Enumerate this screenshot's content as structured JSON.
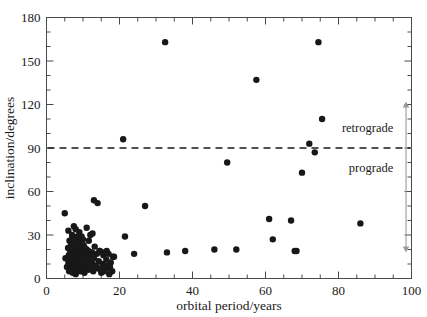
{
  "chart_data": {
    "type": "scatter",
    "title": "",
    "xlabel": "orbital period/years",
    "ylabel": "inclination/degrees",
    "xlim": [
      0,
      100
    ],
    "ylim": [
      0,
      180
    ],
    "xticks": [
      0,
      20,
      40,
      60,
      80,
      100
    ],
    "yticks": [
      0,
      30,
      60,
      90,
      120,
      150,
      180
    ],
    "x_minor_step": 5,
    "y_minor_step": 10,
    "grid": false,
    "legend": "none",
    "marker_color": "#181818",
    "marker_size_px": 3.2,
    "annotations": [
      {
        "name": "threshold-line",
        "type": "hline",
        "y": 90,
        "style": "dashed",
        "color": "#1a1a1a"
      },
      {
        "name": "retrograde-label",
        "type": "text",
        "text": "retrograde",
        "x": 95,
        "y": 104
      },
      {
        "name": "prograde-label",
        "type": "text",
        "text": "prograde",
        "x": 95,
        "y": 76
      },
      {
        "name": "range-arrow",
        "type": "double-arrow",
        "x": 98.5,
        "y_from": 18,
        "y_to": 122,
        "color": "#9a9a9a"
      }
    ],
    "points": [
      [
        5.2,
        14
      ],
      [
        5.6,
        8
      ],
      [
        5.9,
        21
      ],
      [
        6.0,
        11
      ],
      [
        6.1,
        16
      ],
      [
        6.2,
        5
      ],
      [
        6.3,
        26
      ],
      [
        6.4,
        13
      ],
      [
        6.5,
        19
      ],
      [
        6.6,
        9
      ],
      [
        6.7,
        23
      ],
      [
        6.8,
        6
      ],
      [
        6.9,
        17
      ],
      [
        7.0,
        12
      ],
      [
        7.1,
        28
      ],
      [
        7.2,
        4
      ],
      [
        7.3,
        20
      ],
      [
        7.4,
        15
      ],
      [
        7.5,
        10
      ],
      [
        7.6,
        24
      ],
      [
        7.7,
        7
      ],
      [
        7.8,
        18
      ],
      [
        7.9,
        13
      ],
      [
        8.0,
        3
      ],
      [
        8.1,
        22
      ],
      [
        8.2,
        16
      ],
      [
        8.3,
        9
      ],
      [
        8.4,
        27
      ],
      [
        8.5,
        12
      ],
      [
        8.6,
        6
      ],
      [
        8.7,
        19
      ],
      [
        8.8,
        14
      ],
      [
        8.9,
        25
      ],
      [
        9.0,
        8
      ],
      [
        9.1,
        17
      ],
      [
        9.2,
        11
      ],
      [
        9.3,
        5
      ],
      [
        9.4,
        21
      ],
      [
        9.5,
        15
      ],
      [
        9.6,
        29
      ],
      [
        9.7,
        10
      ],
      [
        9.8,
        18
      ],
      [
        9.9,
        7
      ],
      [
        10.0,
        13
      ],
      [
        10.2,
        23
      ],
      [
        10.4,
        4
      ],
      [
        10.6,
        16
      ],
      [
        10.8,
        9
      ],
      [
        11.0,
        20
      ],
      [
        11.2,
        12
      ],
      [
        11.4,
        6
      ],
      [
        11.6,
        26
      ],
      [
        11.8,
        15
      ],
      [
        12.0,
        8
      ],
      [
        12.2,
        18
      ],
      [
        12.4,
        11
      ],
      [
        12.6,
        31
      ],
      [
        12.8,
        5
      ],
      [
        13.0,
        14
      ],
      [
        13.2,
        22
      ],
      [
        13.5,
        9
      ],
      [
        13.8,
        17
      ],
      [
        14.0,
        7
      ],
      [
        14.3,
        12
      ],
      [
        14.6,
        19
      ],
      [
        15.0,
        4
      ],
      [
        15.3,
        10
      ],
      [
        15.6,
        16
      ],
      [
        16.0,
        6
      ],
      [
        16.4,
        13
      ],
      [
        16.8,
        8
      ],
      [
        17.2,
        3
      ],
      [
        17.6,
        11
      ],
      [
        18.0,
        5
      ],
      [
        18.5,
        15
      ],
      [
        5.0,
        45
      ],
      [
        6.0,
        33
      ],
      [
        7.0,
        30
      ],
      [
        7.5,
        36
      ],
      [
        8.0,
        34
      ],
      [
        8.5,
        29
      ],
      [
        9.0,
        32
      ],
      [
        10.0,
        27
      ],
      [
        11.0,
        35
      ],
      [
        12.0,
        30
      ],
      [
        13.0,
        54
      ],
      [
        14.0,
        52
      ],
      [
        10.5,
        21
      ],
      [
        11.5,
        19
      ],
      [
        12.5,
        18
      ],
      [
        14.5,
        19
      ],
      [
        15.5,
        18
      ],
      [
        16.5,
        19
      ],
      [
        17.0,
        17
      ],
      [
        18.2,
        15
      ],
      [
        16.2,
        9
      ],
      [
        16.6,
        7
      ],
      [
        17.4,
        8
      ],
      [
        15.8,
        5
      ],
      [
        14.8,
        6
      ],
      [
        21.0,
        96
      ],
      [
        21.5,
        29
      ],
      [
        24.0,
        17
      ],
      [
        27.0,
        50
      ],
      [
        32.5,
        163
      ],
      [
        33.0,
        18
      ],
      [
        38.0,
        19
      ],
      [
        46.0,
        20
      ],
      [
        49.5,
        80
      ],
      [
        52.0,
        20
      ],
      [
        57.5,
        137
      ],
      [
        61.0,
        41
      ],
      [
        62.0,
        27
      ],
      [
        67.0,
        40
      ],
      [
        68.0,
        19
      ],
      [
        68.5,
        19
      ],
      [
        70.0,
        73
      ],
      [
        72.0,
        93
      ],
      [
        73.5,
        87
      ],
      [
        74.5,
        163
      ],
      [
        75.5,
        110
      ],
      [
        86.0,
        38
      ]
    ]
  },
  "axis": {
    "y_tick_labels": [
      "0",
      "30",
      "60",
      "90",
      "120",
      "150",
      "180"
    ],
    "x_tick_labels": [
      "0",
      "20",
      "40",
      "60",
      "80",
      "100"
    ],
    "x_title": "orbital period/years",
    "y_title": "inclination/degrees"
  },
  "labels": {
    "retrograde": "retrograde",
    "prograde": "prograde"
  }
}
